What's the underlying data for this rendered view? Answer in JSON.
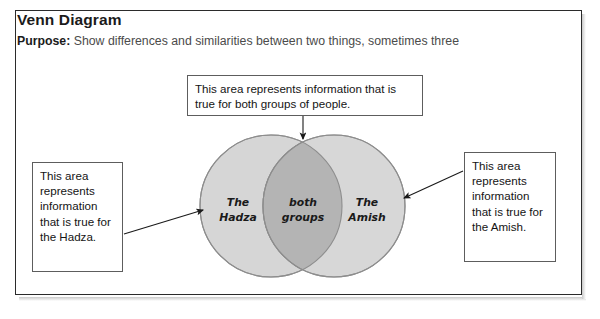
{
  "page": {
    "background_color": "#ffffff",
    "card_border_color": "#2b2b2b"
  },
  "header": {
    "title": "Venn Diagram",
    "purpose_label": "Purpose:",
    "purpose_text": "Show differences and similarities between two things, sometimes three"
  },
  "callouts": {
    "top": {
      "text": "This area represents information that is true for both groups of people."
    },
    "left": {
      "text": "This area represents information that is true for the Hadza."
    },
    "right": {
      "text": "This area represents information that is true for the Amish."
    }
  },
  "diagram": {
    "type": "venn",
    "left_circle_label": "The Hadza",
    "left_circle_label_line1": "The",
    "left_circle_label_line2": "Hadza",
    "right_circle_label": "The Amish",
    "right_circle_label_line1": "The",
    "right_circle_label_line2": "Amish",
    "intersection_label": "both groups",
    "intersection_label_line1": "both",
    "intersection_label_line2": "groups",
    "circle_fill": "#d5d5d5",
    "intersection_fill": "#b3b3b3",
    "circle_stroke": "#8a8a8a",
    "arrow_color": "#1a1a1a"
  }
}
